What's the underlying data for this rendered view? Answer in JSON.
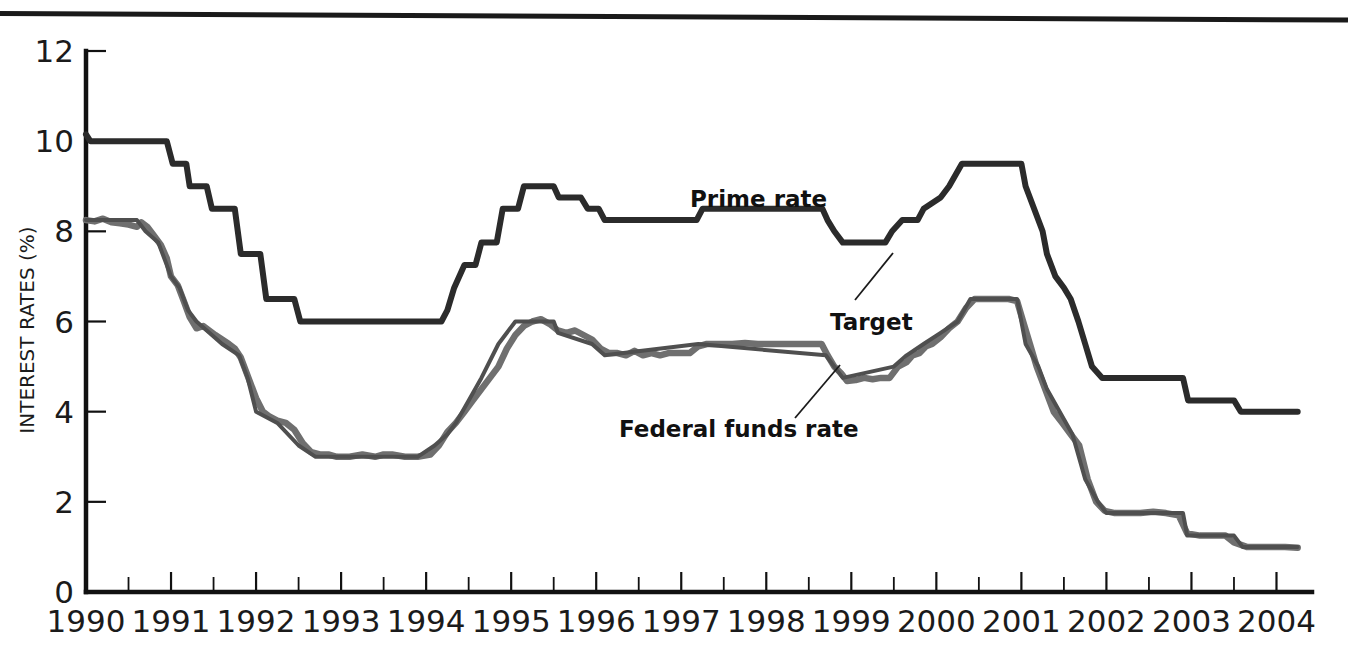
{
  "figure": {
    "has_top_rule": true,
    "background": "#ffffff"
  },
  "axes": {
    "y_title": "INTEREST RATES (%)",
    "y_ticks": [
      "0",
      "2",
      "4",
      "6",
      "8",
      "10",
      "12"
    ],
    "x_ticks": [
      "1990",
      "1991",
      "1992",
      "1993",
      "1994",
      "1995",
      "1996",
      "1997",
      "1998",
      "1999",
      "2000",
      "2001",
      "2002",
      "2003",
      "2004"
    ]
  },
  "annotations": {
    "prime": "Prime rate",
    "target": "Target",
    "federal_funds": "Federal funds rate"
  },
  "colors": {
    "prime_rate": "#2b2b2b",
    "federal_funds": "#6f6f6f",
    "target": "#4f4f4f",
    "axis": "#111111",
    "text": "#1b1b1b"
  },
  "chart_data": {
    "type": "line",
    "title": "",
    "xlabel": "",
    "ylabel": "INTEREST RATES (%)",
    "xlim": [
      1990,
      2004.3
    ],
    "ylim": [
      0,
      12
    ],
    "yticks": [
      0,
      2,
      4,
      6,
      8,
      10,
      12
    ],
    "xticks": [
      1990,
      1991,
      1992,
      1993,
      1994,
      1995,
      1996,
      1997,
      1998,
      1999,
      2000,
      2001,
      2002,
      2003,
      2004
    ],
    "minor_xticks_interval": 0.5,
    "grid": false,
    "legend": "none (inline annotations)",
    "series": [
      {
        "name": "Prime rate",
        "color": "#2b2b2b",
        "style": "step",
        "points": [
          [
            1990.0,
            10.15
          ],
          [
            1990.05,
            10.0
          ],
          [
            1990.95,
            10.0
          ],
          [
            1991.02,
            9.5
          ],
          [
            1991.18,
            9.5
          ],
          [
            1991.22,
            9.0
          ],
          [
            1991.42,
            9.0
          ],
          [
            1991.48,
            8.5
          ],
          [
            1991.75,
            8.5
          ],
          [
            1991.82,
            7.5
          ],
          [
            1992.05,
            7.5
          ],
          [
            1992.12,
            6.5
          ],
          [
            1992.45,
            6.5
          ],
          [
            1992.52,
            6.0
          ],
          [
            1994.18,
            6.0
          ],
          [
            1994.25,
            6.25
          ],
          [
            1994.33,
            6.75
          ],
          [
            1994.45,
            7.25
          ],
          [
            1994.58,
            7.25
          ],
          [
            1994.65,
            7.75
          ],
          [
            1994.83,
            7.75
          ],
          [
            1994.9,
            8.5
          ],
          [
            1995.08,
            8.5
          ],
          [
            1995.15,
            9.0
          ],
          [
            1995.5,
            9.0
          ],
          [
            1995.56,
            8.75
          ],
          [
            1995.82,
            8.75
          ],
          [
            1995.9,
            8.5
          ],
          [
            1996.03,
            8.5
          ],
          [
            1996.1,
            8.25
          ],
          [
            1997.18,
            8.25
          ],
          [
            1997.25,
            8.5
          ],
          [
            1998.66,
            8.5
          ],
          [
            1998.72,
            8.25
          ],
          [
            1998.8,
            8.0
          ],
          [
            1998.9,
            7.75
          ],
          [
            1999.4,
            7.75
          ],
          [
            1999.48,
            8.0
          ],
          [
            1999.6,
            8.25
          ],
          [
            1999.78,
            8.25
          ],
          [
            1999.85,
            8.5
          ],
          [
            2000.05,
            8.75
          ],
          [
            2000.15,
            9.0
          ],
          [
            2000.3,
            9.5
          ],
          [
            2000.42,
            9.5
          ],
          [
            2000.5,
            9.5
          ],
          [
            2001.0,
            9.5
          ],
          [
            2001.05,
            9.0
          ],
          [
            2001.15,
            8.5
          ],
          [
            2001.25,
            8.0
          ],
          [
            2001.3,
            7.5
          ],
          [
            2001.4,
            7.0
          ],
          [
            2001.5,
            6.75
          ],
          [
            2001.58,
            6.5
          ],
          [
            2001.67,
            6.0
          ],
          [
            2001.75,
            5.5
          ],
          [
            2001.83,
            5.0
          ],
          [
            2001.95,
            4.75
          ],
          [
            2002.05,
            4.75
          ],
          [
            2002.9,
            4.75
          ],
          [
            2002.96,
            4.25
          ],
          [
            2003.5,
            4.25
          ],
          [
            2003.58,
            4.0
          ],
          [
            2004.25,
            4.0
          ]
        ]
      },
      {
        "name": "Federal funds rate",
        "color": "#6f6f6f",
        "style": "noisy line",
        "points": [
          [
            1990.0,
            8.25
          ],
          [
            1990.1,
            8.22
          ],
          [
            1990.2,
            8.28
          ],
          [
            1990.3,
            8.2
          ],
          [
            1990.4,
            8.18
          ],
          [
            1990.5,
            8.15
          ],
          [
            1990.6,
            8.1
          ],
          [
            1990.65,
            8.2
          ],
          [
            1990.72,
            8.1
          ],
          [
            1990.8,
            7.9
          ],
          [
            1990.88,
            7.7
          ],
          [
            1990.95,
            7.4
          ],
          [
            1991.0,
            7.0
          ],
          [
            1991.08,
            6.8
          ],
          [
            1991.15,
            6.45
          ],
          [
            1991.22,
            6.1
          ],
          [
            1991.3,
            5.85
          ],
          [
            1991.38,
            5.9
          ],
          [
            1991.45,
            5.8
          ],
          [
            1991.52,
            5.7
          ],
          [
            1991.6,
            5.6
          ],
          [
            1991.68,
            5.5
          ],
          [
            1991.75,
            5.4
          ],
          [
            1991.82,
            5.2
          ],
          [
            1991.9,
            4.8
          ],
          [
            1992.0,
            4.3
          ],
          [
            1992.08,
            4.0
          ],
          [
            1992.15,
            3.9
          ],
          [
            1992.25,
            3.8
          ],
          [
            1992.35,
            3.75
          ],
          [
            1992.45,
            3.6
          ],
          [
            1992.55,
            3.3
          ],
          [
            1992.65,
            3.1
          ],
          [
            1992.75,
            3.05
          ],
          [
            1992.85,
            3.05
          ],
          [
            1992.95,
            3.0
          ],
          [
            1993.1,
            3.0
          ],
          [
            1993.25,
            3.05
          ],
          [
            1993.4,
            3.0
          ],
          [
            1993.5,
            3.05
          ],
          [
            1993.6,
            3.05
          ],
          [
            1993.75,
            3.0
          ],
          [
            1993.9,
            3.0
          ],
          [
            1994.05,
            3.05
          ],
          [
            1994.15,
            3.25
          ],
          [
            1994.25,
            3.55
          ],
          [
            1994.35,
            3.75
          ],
          [
            1994.45,
            4.0
          ],
          [
            1994.55,
            4.25
          ],
          [
            1994.65,
            4.5
          ],
          [
            1994.75,
            4.75
          ],
          [
            1994.85,
            5.0
          ],
          [
            1994.95,
            5.4
          ],
          [
            1995.05,
            5.7
          ],
          [
            1995.15,
            5.9
          ],
          [
            1995.25,
            6.0
          ],
          [
            1995.35,
            6.05
          ],
          [
            1995.45,
            5.95
          ],
          [
            1995.55,
            5.8
          ],
          [
            1995.65,
            5.75
          ],
          [
            1995.75,
            5.8
          ],
          [
            1995.85,
            5.7
          ],
          [
            1995.95,
            5.6
          ],
          [
            1996.05,
            5.4
          ],
          [
            1996.15,
            5.3
          ],
          [
            1996.25,
            5.3
          ],
          [
            1996.35,
            5.25
          ],
          [
            1996.45,
            5.35
          ],
          [
            1996.55,
            5.25
          ],
          [
            1996.65,
            5.3
          ],
          [
            1996.75,
            5.25
          ],
          [
            1996.85,
            5.3
          ],
          [
            1996.95,
            5.3
          ],
          [
            1997.1,
            5.3
          ],
          [
            1997.2,
            5.45
          ],
          [
            1997.3,
            5.5
          ],
          [
            1997.45,
            5.5
          ],
          [
            1997.6,
            5.5
          ],
          [
            1997.75,
            5.52
          ],
          [
            1997.9,
            5.5
          ],
          [
            1998.1,
            5.5
          ],
          [
            1998.25,
            5.5
          ],
          [
            1998.4,
            5.5
          ],
          [
            1998.55,
            5.5
          ],
          [
            1998.65,
            5.5
          ],
          [
            1998.72,
            5.25
          ],
          [
            1998.8,
            5.0
          ],
          [
            1998.88,
            4.85
          ],
          [
            1998.95,
            4.68
          ],
          [
            1999.05,
            4.7
          ],
          [
            1999.15,
            4.75
          ],
          [
            1999.25,
            4.72
          ],
          [
            1999.35,
            4.75
          ],
          [
            1999.45,
            4.75
          ],
          [
            1999.55,
            5.0
          ],
          [
            1999.65,
            5.1
          ],
          [
            1999.72,
            5.25
          ],
          [
            1999.8,
            5.3
          ],
          [
            1999.88,
            5.45
          ],
          [
            1999.95,
            5.5
          ],
          [
            2000.05,
            5.65
          ],
          [
            2000.15,
            5.85
          ],
          [
            2000.25,
            6.0
          ],
          [
            2000.35,
            6.3
          ],
          [
            2000.45,
            6.5
          ],
          [
            2000.55,
            6.5
          ],
          [
            2000.7,
            6.5
          ],
          [
            2000.85,
            6.5
          ],
          [
            2000.95,
            6.45
          ],
          [
            2001.02,
            6.0
          ],
          [
            2001.1,
            5.5
          ],
          [
            2001.18,
            5.0
          ],
          [
            2001.28,
            4.5
          ],
          [
            2001.38,
            4.0
          ],
          [
            2001.48,
            3.75
          ],
          [
            2001.58,
            3.5
          ],
          [
            2001.68,
            3.25
          ],
          [
            2001.78,
            2.5
          ],
          [
            2001.88,
            2.0
          ],
          [
            2001.98,
            1.8
          ],
          [
            2002.1,
            1.75
          ],
          [
            2002.25,
            1.75
          ],
          [
            2002.4,
            1.75
          ],
          [
            2002.55,
            1.78
          ],
          [
            2002.7,
            1.75
          ],
          [
            2002.85,
            1.7
          ],
          [
            2002.95,
            1.3
          ],
          [
            2003.1,
            1.25
          ],
          [
            2003.25,
            1.25
          ],
          [
            2003.4,
            1.25
          ],
          [
            2003.5,
            1.1
          ],
          [
            2003.65,
            1.0
          ],
          [
            2003.8,
            1.0
          ],
          [
            2003.95,
            1.0
          ],
          [
            2004.1,
            1.0
          ],
          [
            2004.25,
            0.98
          ]
        ]
      },
      {
        "name": "Target",
        "color": "#4f4f4f",
        "style": "step (overlaid on federal funds rate)",
        "points": [
          [
            1990.0,
            8.25
          ],
          [
            1990.6,
            8.25
          ],
          [
            1990.7,
            8.0
          ],
          [
            1990.85,
            7.75
          ],
          [
            1990.95,
            7.25
          ],
          [
            1991.0,
            7.0
          ],
          [
            1991.1,
            6.75
          ],
          [
            1991.2,
            6.25
          ],
          [
            1991.3,
            6.0
          ],
          [
            1991.45,
            5.75
          ],
          [
            1991.6,
            5.5
          ],
          [
            1991.8,
            5.25
          ],
          [
            1991.9,
            4.75
          ],
          [
            1992.0,
            4.0
          ],
          [
            1992.25,
            3.75
          ],
          [
            1992.5,
            3.25
          ],
          [
            1992.7,
            3.0
          ],
          [
            1993.9,
            3.0
          ],
          [
            1994.1,
            3.25
          ],
          [
            1994.25,
            3.5
          ],
          [
            1994.35,
            3.75
          ],
          [
            1994.5,
            4.25
          ],
          [
            1994.65,
            4.75
          ],
          [
            1994.85,
            5.5
          ],
          [
            1995.05,
            6.0
          ],
          [
            1995.5,
            6.0
          ],
          [
            1995.55,
            5.75
          ],
          [
            1995.95,
            5.5
          ],
          [
            1996.1,
            5.25
          ],
          [
            1997.2,
            5.5
          ],
          [
            1998.7,
            5.25
          ],
          [
            1998.8,
            5.0
          ],
          [
            1998.9,
            4.75
          ],
          [
            1999.5,
            5.0
          ],
          [
            1999.65,
            5.25
          ],
          [
            1999.85,
            5.5
          ],
          [
            2000.05,
            5.75
          ],
          [
            2000.25,
            6.0
          ],
          [
            2000.4,
            6.5
          ],
          [
            2000.95,
            6.5
          ],
          [
            2001.05,
            5.5
          ],
          [
            2001.2,
            5.0
          ],
          [
            2001.3,
            4.5
          ],
          [
            2001.45,
            4.0
          ],
          [
            2001.6,
            3.5
          ],
          [
            2001.75,
            2.5
          ],
          [
            2001.9,
            2.0
          ],
          [
            2002.0,
            1.75
          ],
          [
            2002.9,
            1.75
          ],
          [
            2002.95,
            1.25
          ],
          [
            2003.5,
            1.25
          ],
          [
            2003.6,
            1.0
          ],
          [
            2004.25,
            1.0
          ]
        ]
      }
    ],
    "annotations": [
      {
        "text": "Prime rate",
        "x": 1997.1,
        "y": 8.75
      },
      {
        "text": "Target",
        "x": 1999.35,
        "y": 6.25
      },
      {
        "text": "Federal funds rate",
        "x": 1998.0,
        "y": 4.15
      }
    ]
  }
}
